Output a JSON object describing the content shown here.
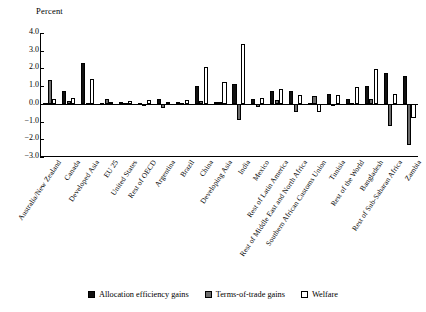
{
  "chart_data": {
    "type": "bar",
    "title": "",
    "ylabel": "Percent",
    "xlabel": "",
    "ylim": [
      -3.0,
      4.0
    ],
    "yticks": [
      "4.0",
      "3.0",
      "2.0",
      "1.0",
      "0.0",
      "−1.0",
      "−2.0",
      "−3.0"
    ],
    "ytick_values": [
      4.0,
      3.0,
      2.0,
      1.0,
      0.0,
      -1.0,
      -2.0,
      -3.0
    ],
    "grid": false,
    "legend_position": "bottom-center",
    "categories": [
      "Australia/New Zealand",
      "Canada",
      "Developed Asia",
      "EU 25",
      "United States",
      "Rest of OECD",
      "Argentina",
      "Brazil",
      "China",
      "Developing Asia",
      "India",
      "Mexico",
      "Rest of Latin America",
      "Rest of Middle East and North Africa",
      "Southern African Customs Union",
      "Tunisia",
      "Rest of the World",
      "Bangladesh",
      "Rest of Sub-Saharan Africa",
      "Zambia"
    ],
    "series": [
      {
        "name": "Allocation efficiency gains",
        "color": "#111111",
        "values": [
          0.05,
          0.7,
          2.28,
          0.05,
          0.08,
          0.05,
          0.28,
          0.08,
          1.02,
          0.12,
          1.1,
          0.3,
          0.7,
          0.75,
          0.05,
          0.58,
          0.25,
          1.02,
          1.75,
          1.6
        ]
      },
      {
        "name": "Terms-of-trade gains",
        "color": "#6d6d6d",
        "values": [
          1.32,
          0.14,
          0.05,
          0.3,
          0.05,
          0.02,
          -0.22,
          0.05,
          0.16,
          0.08,
          -0.9,
          -0.15,
          0.2,
          -0.45,
          0.42,
          -0.12,
          0.05,
          0.3,
          -1.25,
          -2.3
        ]
      },
      {
        "name": "Welfare",
        "color": "#ffffff",
        "values": [
          0.28,
          0.35,
          1.4,
          0.1,
          0.18,
          0.2,
          0.12,
          0.22,
          2.08,
          1.24,
          3.38,
          0.32,
          0.85,
          0.5,
          -0.48,
          0.48,
          0.95,
          1.98,
          0.55,
          -0.82
        ]
      }
    ]
  },
  "legend": {
    "items": [
      {
        "label": "Allocation efficiency gains"
      },
      {
        "label": "Terms-of-trade gains"
      },
      {
        "label": "Welfare"
      }
    ]
  }
}
